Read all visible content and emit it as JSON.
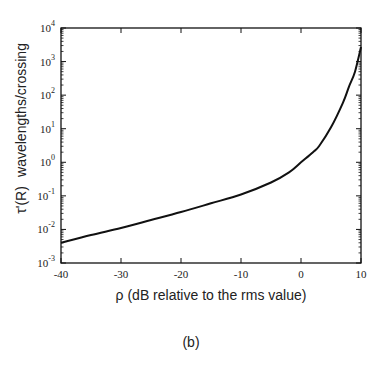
{
  "chart_data": {
    "type": "line",
    "title": "",
    "caption": "(b)",
    "xlabel": "ρ   (dB relative to the rms value)",
    "ylabel_symbol": "τ'(R)",
    "ylabel_text": "wavelengths/crossing",
    "xlim": [
      -40,
      10
    ],
    "ylim": [
      0.001,
      10000
    ],
    "yscale": "log",
    "grid": false,
    "legend": null,
    "x_ticks": [
      -40,
      -30,
      -20,
      -10,
      0,
      10
    ],
    "x_tick_labels": [
      "-40",
      "-30",
      "-20",
      "-10",
      "0",
      "10"
    ],
    "y_ticks_exp": [
      4,
      3,
      2,
      1,
      0,
      -1,
      -2,
      -3
    ],
    "series": [
      {
        "name": "tau'(R)",
        "x": [
          -40,
          -35,
          -30,
          -25,
          -20,
          -15,
          -10,
          -5,
          -2,
          0,
          2,
          3,
          5,
          7,
          8,
          9,
          10
        ],
        "values": [
          0.004,
          0.0068,
          0.011,
          0.019,
          0.033,
          0.06,
          0.11,
          0.25,
          0.5,
          1.0,
          2.0,
          3.0,
          11,
          60,
          180,
          500,
          2700
        ]
      }
    ]
  }
}
